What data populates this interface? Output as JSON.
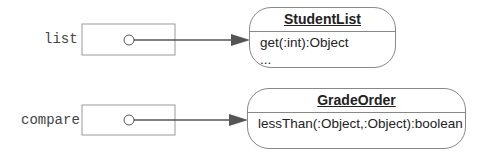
{
  "variables": [
    {
      "name": "list",
      "target": "StudentList"
    },
    {
      "name": "compare",
      "target": "GradeOrder"
    }
  ],
  "objects": [
    {
      "class_name": "StudentList",
      "operations": [
        "get(:int):Object",
        "..."
      ]
    },
    {
      "class_name": "GradeOrder",
      "operations": [
        "lessThan(:Object,:Object):boolean"
      ]
    }
  ],
  "colors": {
    "line": "#666666",
    "box": "#888888"
  }
}
